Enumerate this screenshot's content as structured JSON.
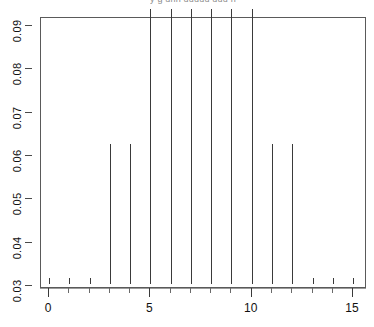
{
  "figure": {
    "title_partial": "y g  unn uuuuu  uuu n",
    "background": "#ffffff",
    "frame_color": "#5a5a5a",
    "spike_color": "#3a3a3a"
  },
  "chart_data": {
    "type": "bar",
    "title": "",
    "subtitle": "",
    "xlabel": "",
    "ylabel": "",
    "xlim": [
      -0.4,
      15.9
    ],
    "ylim": [
      0.03,
      0.0935
    ],
    "grid": false,
    "legend": null,
    "style": "spike-plot",
    "x_ticks_major": [
      0,
      5,
      10,
      15
    ],
    "x_tick_labels": [
      "0",
      "5",
      "10",
      "15"
    ],
    "x_ticks_minor": [
      0,
      1,
      2,
      3,
      4,
      5,
      6,
      7,
      8,
      9,
      10,
      11,
      12,
      13,
      14,
      15
    ],
    "y_ticks": [
      0.03,
      0.04,
      0.05,
      0.06,
      0.07,
      0.08,
      0.09
    ],
    "y_tick_labels": [
      "0.03",
      "0.04",
      "0.05",
      "0.06",
      "0.07",
      "0.08",
      "0.09"
    ],
    "categories": [
      0,
      1,
      2,
      3,
      4,
      5,
      6,
      7,
      8,
      9,
      10,
      11,
      12,
      13,
      14,
      15
    ],
    "values": [
      0.0315,
      0.0315,
      0.0315,
      0.0622,
      0.0622,
      0.0935,
      0.0935,
      0.0935,
      0.0935,
      0.0935,
      0.0935,
      0.0622,
      0.0622,
      0.0315,
      0.0315,
      0.0315
    ]
  }
}
